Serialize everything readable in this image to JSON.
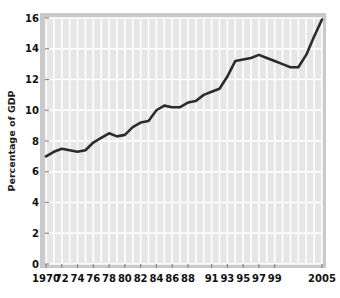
{
  "chart_data": {
    "type": "line",
    "title": "",
    "xlabel": "",
    "ylabel": "Percentage of GDP",
    "ylim": [
      0,
      16
    ],
    "xlim": [
      1970,
      2005
    ],
    "yticks": [
      0,
      2,
      4,
      6,
      8,
      10,
      12,
      14,
      16
    ],
    "ytick_labels": [
      "0",
      "2",
      "4",
      "6",
      "8",
      "10",
      "12",
      "14",
      "16"
    ],
    "xticks": [
      1970,
      1972,
      1974,
      1976,
      1978,
      1980,
      1982,
      1984,
      1986,
      1988,
      1991,
      1993,
      1995,
      1997,
      1999,
      2005
    ],
    "xtick_labels": [
      "1970",
      "72",
      "74",
      "76",
      "78",
      "80",
      "82",
      "84",
      "86",
      "88",
      "91",
      "93",
      "95",
      "97",
      "99",
      "2005"
    ],
    "grid": true,
    "grid_color": "#ffffff",
    "plot_background": "#e6e6e6",
    "line_color": "#2b2b2b",
    "legend": null,
    "x": [
      1970,
      1971,
      1972,
      1973,
      1974,
      1975,
      1976,
      1977,
      1978,
      1979,
      1980,
      1981,
      1982,
      1983,
      1984,
      1985,
      1986,
      1987,
      1988,
      1989,
      1990,
      1991,
      1992,
      1993,
      1994,
      1995,
      1996,
      1997,
      1998,
      1999,
      2000,
      2001,
      2002,
      2003,
      2004,
      2005
    ],
    "values": [
      7.0,
      7.3,
      7.5,
      7.4,
      7.3,
      7.4,
      7.9,
      8.2,
      8.5,
      8.3,
      8.4,
      8.9,
      9.2,
      9.3,
      10.0,
      10.3,
      10.2,
      10.2,
      10.5,
      10.6,
      11.0,
      11.2,
      11.4,
      12.2,
      13.2,
      13.3,
      13.4,
      13.6,
      13.4,
      13.2,
      13.0,
      12.8,
      12.8,
      13.6,
      14.8,
      15.9
    ],
    "series": [
      {
        "name": "Percentage of GDP",
        "values": [
          7.0,
          7.3,
          7.5,
          7.4,
          7.3,
          7.4,
          7.9,
          8.2,
          8.5,
          8.3,
          8.4,
          8.9,
          9.2,
          9.3,
          10.0,
          10.3,
          10.2,
          10.2,
          10.5,
          10.6,
          11.0,
          11.2,
          11.4,
          12.2,
          13.2,
          13.3,
          13.4,
          13.6,
          13.4,
          13.2,
          13.0,
          12.8,
          12.8,
          13.6,
          14.8,
          15.9
        ]
      }
    ]
  },
  "axes": {
    "y_axis_title": "Percentage of GDP"
  }
}
